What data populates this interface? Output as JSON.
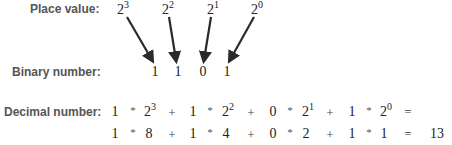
{
  "labels": {
    "place_value": "Place value:",
    "binary_number": "Binary number:",
    "decimal_number": "Decimal number:"
  },
  "place_values": [
    {
      "base": "2",
      "exp": "3"
    },
    {
      "base": "2",
      "exp": "2"
    },
    {
      "base": "2",
      "exp": "1"
    },
    {
      "base": "2",
      "exp": "0"
    }
  ],
  "binary_digits": [
    "1",
    "1",
    "0",
    "1"
  ],
  "decimal_row1": {
    "terms": [
      {
        "digit": "1",
        "op": "*",
        "base": "2",
        "exp": "3"
      },
      {
        "digit": "1",
        "op": "*",
        "base": "2",
        "exp": "2"
      },
      {
        "digit": "0",
        "op": "*",
        "base": "2",
        "exp": "1"
      },
      {
        "digit": "1",
        "op": "*",
        "base": "2",
        "exp": "0"
      }
    ],
    "plus": "+",
    "equals": "="
  },
  "decimal_row2": {
    "terms": [
      {
        "digit": "1",
        "op": "*",
        "value": "8"
      },
      {
        "digit": "1",
        "op": "*",
        "value": "4"
      },
      {
        "digit": "0",
        "op": "*",
        "value": "2"
      },
      {
        "digit": "1",
        "op": "*",
        "value": "1"
      }
    ],
    "plus": "+",
    "equals": "=",
    "result": "13"
  },
  "colors": {
    "label": "#555555",
    "text": "#222222",
    "arrow": "#2a2a2a"
  }
}
